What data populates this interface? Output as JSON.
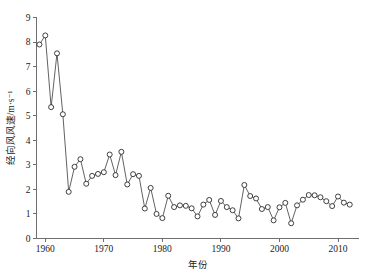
{
  "chart_data": {
    "type": "line",
    "title": "",
    "subtitle": "",
    "xlabel": "年份",
    "ylabel": "经向风风速/m·s⁻¹",
    "xlim": [
      1958.5,
      2013.5
    ],
    "ylim": [
      0,
      9
    ],
    "xticks": [
      1960,
      1970,
      1980,
      1990,
      2000,
      2010
    ],
    "xtick_labels": [
      "1960",
      "1970",
      "1980",
      "1990",
      "2000",
      "2010"
    ],
    "yticks": [
      0,
      1,
      2,
      3,
      4,
      5,
      6,
      7,
      8,
      9
    ],
    "ytick_labels": [
      "0",
      "1",
      "2",
      "3",
      "4",
      "5",
      "6",
      "7",
      "8",
      "9"
    ],
    "grid": false,
    "legend": false,
    "legend_position": "none",
    "marker": "open-circle",
    "line_color": "#3a3a3a",
    "marker_face_color": "#ffffff",
    "marker_edge_color": "#2b2b2b",
    "axis_color": "#6f6f6f",
    "x": [
      1959,
      1960,
      1961,
      1962,
      1963,
      1964,
      1965,
      1966,
      1967,
      1968,
      1969,
      1970,
      1971,
      1972,
      1973,
      1974,
      1975,
      1976,
      1977,
      1978,
      1979,
      1980,
      1981,
      1982,
      1983,
      1984,
      1985,
      1986,
      1987,
      1988,
      1989,
      1990,
      1991,
      1992,
      1993,
      1994,
      1995,
      1996,
      1997,
      1998,
      1999,
      2000,
      2001,
      2002,
      2003,
      2004,
      2005,
      2006,
      2007,
      2008,
      2009,
      2010,
      2011,
      2012
    ],
    "y": [
      7.9,
      8.27,
      5.35,
      7.54,
      5.06,
      1.9,
      2.92,
      3.23,
      2.23,
      2.55,
      2.63,
      2.7,
      3.42,
      2.58,
      3.53,
      2.2,
      2.62,
      2.55,
      1.22,
      2.06,
      1.0,
      0.83,
      1.74,
      1.28,
      1.35,
      1.33,
      1.23,
      0.9,
      1.38,
      1.57,
      0.96,
      1.53,
      1.28,
      1.15,
      0.82,
      2.18,
      1.73,
      1.63,
      1.2,
      1.28,
      0.74,
      1.27,
      1.45,
      0.62,
      1.35,
      1.58,
      1.77,
      1.76,
      1.68,
      1.52,
      1.32,
      1.71,
      1.46,
      1.38
    ],
    "series": [
      {
        "name": "经向风风速",
        "values": [
          7.9,
          8.27,
          5.35,
          7.54,
          5.06,
          1.9,
          2.92,
          3.23,
          2.23,
          2.55,
          2.63,
          2.7,
          3.42,
          2.58,
          3.53,
          2.2,
          2.62,
          2.55,
          1.22,
          2.06,
          1.0,
          0.83,
          1.74,
          1.28,
          1.35,
          1.33,
          1.23,
          0.9,
          1.38,
          1.57,
          0.96,
          1.53,
          1.28,
          1.15,
          0.82,
          2.18,
          1.73,
          1.63,
          1.2,
          1.28,
          0.74,
          1.27,
          1.45,
          0.62,
          1.35,
          1.58,
          1.77,
          1.76,
          1.68,
          1.52,
          1.32,
          1.71,
          1.46,
          1.38
        ]
      }
    ]
  }
}
